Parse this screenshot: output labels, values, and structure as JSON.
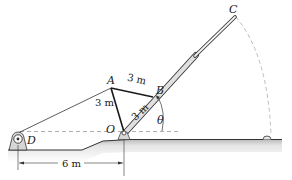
{
  "figure": {
    "points": {
      "A": {
        "label": "A"
      },
      "B": {
        "label": "B"
      },
      "C": {
        "label": "C"
      },
      "O": {
        "label": "O"
      },
      "D": {
        "label": "D"
      }
    },
    "dimensions": {
      "AB": "3 m",
      "AO": "3 m",
      "OB": "3 m",
      "DO": "6 m"
    },
    "angle": {
      "label": "θ"
    },
    "colors": {
      "line": "#1a1a1a",
      "boom_fill": "#d9d9d9",
      "ground_fill": "#cfcfcf",
      "dashed": "#9a9a9a",
      "arc": "#bdbdbd"
    }
  }
}
